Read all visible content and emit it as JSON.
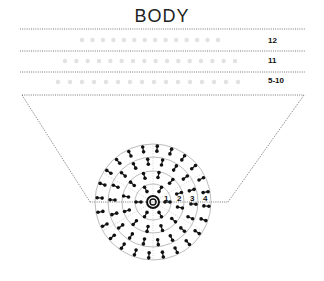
{
  "title": "BODY",
  "rows": [
    {
      "label": "12"
    },
    {
      "label": "11"
    },
    {
      "label": "5-10"
    }
  ],
  "ring_labels": [
    "1",
    "2",
    "3",
    "4"
  ],
  "colors": {
    "line": "#555555",
    "faint": "#d9d9d9",
    "ink": "#111111",
    "ring": "#aaaaaa"
  }
}
